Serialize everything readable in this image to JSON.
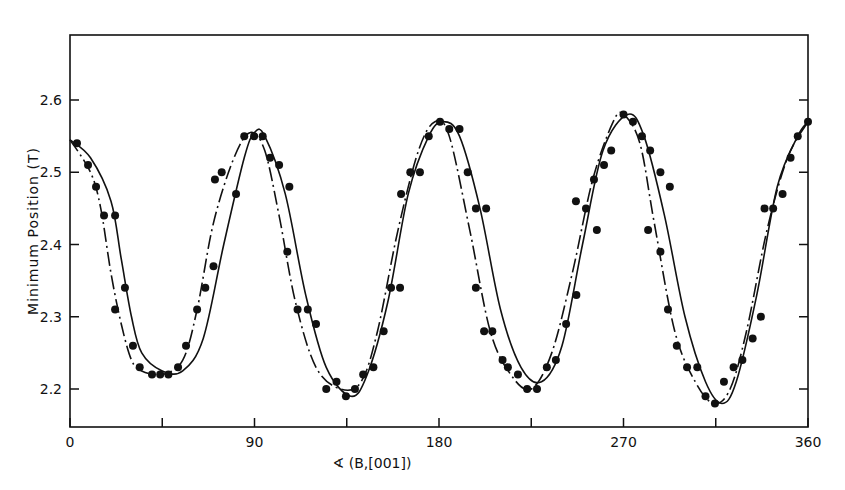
{
  "chart_data": {
    "type": "scatter",
    "title": "",
    "xlabel": "∢ (B,[001])",
    "ylabel": "Minimum Position (T)",
    "xlim": [
      0,
      360
    ],
    "ylim": [
      2.145,
      2.69
    ],
    "xticks": [
      0,
      45,
      90,
      135,
      180,
      225,
      270,
      315,
      360
    ],
    "xtick_labels": [
      "0",
      "",
      "90",
      "",
      "180",
      "",
      "270",
      "",
      "360"
    ],
    "yticks": [
      2.2,
      2.3,
      2.4,
      2.5,
      2.6
    ],
    "ytick_labels": [
      "2.2",
      "2.3",
      "2.4",
      "2.5",
      "2.6"
    ],
    "grid": false,
    "legend": null,
    "series": [
      {
        "name": "measured minima",
        "style": "filled-dots",
        "x": [
          3.4,
          8.8,
          12.7,
          16.6,
          22,
          22,
          26.8,
          30.7,
          34,
          40,
          44,
          48,
          52.7,
          56.6,
          62,
          66,
          70,
          70.7,
          74,
          81,
          85,
          89.8,
          94,
          97.6,
          102,
          107,
          106,
          111,
          116,
          120,
          125,
          130,
          134.6,
          139,
          143,
          148,
          153,
          156.6,
          161,
          161.5,
          166,
          170.7,
          175,
          180.5,
          185,
          190,
          194,
          198,
          203,
          198,
          202,
          206,
          211,
          213.6,
          218.5,
          223,
          227.8,
          232.6,
          237,
          242,
          247,
          246.8,
          251.7,
          255.6,
          257,
          260.5,
          264,
          270,
          274.6,
          279,
          283,
          288,
          292.6,
          282,
          288,
          291.7,
          296,
          301,
          306,
          310,
          314.6,
          319,
          323.7,
          328,
          333,
          337,
          338.8,
          343,
          347.6,
          351.5,
          355,
          360
        ],
        "y": [
          2.54,
          2.51,
          2.48,
          2.44,
          2.44,
          2.31,
          2.34,
          2.26,
          2.23,
          2.22,
          2.22,
          2.22,
          2.23,
          2.26,
          2.31,
          2.34,
          2.37,
          2.49,
          2.5,
          2.47,
          2.55,
          2.55,
          2.55,
          2.52,
          2.51,
          2.48,
          2.39,
          2.31,
          2.31,
          2.29,
          2.2,
          2.21,
          2.19,
          2.2,
          2.22,
          2.23,
          2.28,
          2.34,
          2.34,
          2.47,
          2.5,
          2.5,
          2.55,
          2.57,
          2.56,
          2.56,
          2.5,
          2.45,
          2.45,
          2.34,
          2.28,
          2.28,
          2.24,
          2.23,
          2.22,
          2.2,
          2.2,
          2.23,
          2.24,
          2.29,
          2.33,
          2.46,
          2.45,
          2.49,
          2.42,
          2.51,
          2.53,
          2.58,
          2.57,
          2.55,
          2.53,
          2.5,
          2.48,
          2.42,
          2.39,
          2.31,
          2.26,
          2.23,
          2.23,
          2.19,
          2.18,
          2.21,
          2.23,
          2.24,
          2.27,
          2.3,
          2.45,
          2.45,
          2.47,
          2.52,
          2.55,
          2.57
        ]
      },
      {
        "name": "fit curve A",
        "style": "solid-line",
        "x": [
          0,
          10,
          20,
          25,
          30,
          35,
          45,
          55,
          65,
          75,
          85,
          90,
          95,
          105,
          115,
          125,
          137,
          145,
          155,
          165,
          175,
          182,
          190,
          200,
          210,
          220,
          230,
          240,
          250,
          260,
          272,
          280,
          290,
          300,
          310,
          318,
          325,
          335,
          345,
          355,
          360
        ],
        "y": [
          2.545,
          2.52,
          2.46,
          2.38,
          2.3,
          2.25,
          2.225,
          2.225,
          2.27,
          2.4,
          2.52,
          2.555,
          2.55,
          2.47,
          2.33,
          2.23,
          2.19,
          2.22,
          2.32,
          2.47,
          2.55,
          2.57,
          2.55,
          2.45,
          2.31,
          2.23,
          2.21,
          2.26,
          2.4,
          2.53,
          2.58,
          2.55,
          2.44,
          2.3,
          2.21,
          2.18,
          2.21,
          2.33,
          2.48,
          2.55,
          2.57
        ]
      },
      {
        "name": "fit curve B",
        "style": "dash-dot-line",
        "x": [
          0,
          10,
          15,
          20,
          25,
          30,
          35,
          45,
          55,
          62,
          70,
          80,
          88,
          95,
          102,
          110,
          120,
          132,
          142,
          150,
          160,
          170,
          178,
          185,
          195,
          205,
          215,
          225,
          235,
          245,
          255,
          265,
          270,
          278,
          285,
          295,
          305,
          314,
          322,
          330,
          340,
          350,
          360
        ],
        "y": [
          2.545,
          2.5,
          2.45,
          2.36,
          2.29,
          2.24,
          2.225,
          2.22,
          2.24,
          2.31,
          2.43,
          2.52,
          2.555,
          2.53,
          2.44,
          2.32,
          2.23,
          2.2,
          2.21,
          2.28,
          2.42,
          2.53,
          2.57,
          2.55,
          2.42,
          2.28,
          2.22,
          2.2,
          2.25,
          2.36,
          2.49,
          2.57,
          2.58,
          2.54,
          2.43,
          2.28,
          2.21,
          2.18,
          2.2,
          2.28,
          2.42,
          2.52,
          2.57
        ]
      }
    ]
  },
  "labels": {
    "ylabel": "Minimum Position (T)",
    "xlabel": "∢ (B,[001])"
  }
}
